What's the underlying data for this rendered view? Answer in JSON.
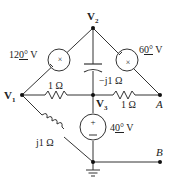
{
  "diagram": {
    "type": "circuit",
    "nodes": {
      "v1": {
        "label": "V",
        "sub": "1"
      },
      "v2": {
        "label": "V",
        "sub": "2"
      },
      "v3": {
        "label": "V",
        "sub": "3"
      },
      "a": {
        "label": "A"
      },
      "b": {
        "label": "B"
      }
    },
    "components": {
      "source_12": {
        "label": "12",
        "angle": "0°",
        "unit": "V",
        "between": [
          "V1",
          "V2"
        ]
      },
      "source_6": {
        "label": "6",
        "angle": "0°",
        "unit": "V",
        "between": [
          "V2",
          "A"
        ]
      },
      "source_4": {
        "label": "4",
        "angle": "0°",
        "unit": "V",
        "between": [
          "V3",
          "ground"
        ]
      },
      "capacitor": {
        "label": "−j1 Ω",
        "between": [
          "V2",
          "V3"
        ]
      },
      "resistor_left": {
        "label": "1 Ω",
        "between": [
          "V1",
          "V3"
        ]
      },
      "resistor_right": {
        "label": "1 Ω",
        "between": [
          "V3",
          "A"
        ]
      },
      "inductor": {
        "label": "j1 Ω",
        "between": [
          "V1",
          "ground"
        ]
      }
    },
    "ground": {
      "symbol": "ground-icon"
    }
  }
}
